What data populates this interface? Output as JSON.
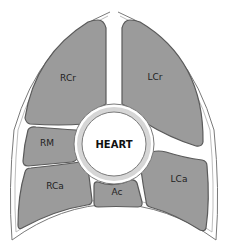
{
  "diagram": {
    "colors": {
      "background": "#ffffff",
      "region_fill": "#9b9b9b",
      "region_stroke": "#5a5a5a",
      "outline": "#7a7a7a",
      "ring_fill": "#d6d6d6",
      "heart_fill": "#ffffff"
    },
    "center": {
      "label": "HEART"
    },
    "regions": [
      {
        "id": "rcr",
        "label": "RCr"
      },
      {
        "id": "lcr",
        "label": "LCr"
      },
      {
        "id": "rm",
        "label": "RM"
      },
      {
        "id": "rca",
        "label": "RCa"
      },
      {
        "id": "ac",
        "label": "Ac"
      },
      {
        "id": "lca",
        "label": "LCa"
      }
    ]
  }
}
